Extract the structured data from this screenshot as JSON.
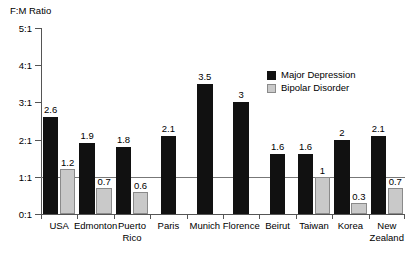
{
  "chart_data": {
    "type": "bar",
    "title": "",
    "ylabel": "F:M Ratio",
    "xlabel": "",
    "ylim": [
      0,
      5
    ],
    "ytick_labels": [
      "0:1",
      "1:1",
      "2:1",
      "3:1",
      "4:1",
      "5:1"
    ],
    "ytick_values": [
      0,
      1,
      2,
      3,
      4,
      5
    ],
    "grid": false,
    "reference_line": 1,
    "legend_position": "upper right",
    "categories": [
      "USA",
      "Edmonton",
      "Puerto\nRico",
      "Paris",
      "Munich",
      "Florence",
      "Beirut",
      "Taiwan",
      "Korea",
      "New\nZealand"
    ],
    "series": [
      {
        "name": "Major Depression",
        "color": "#111111",
        "values": [
          2.6,
          1.9,
          1.8,
          2.1,
          3.5,
          3,
          1.6,
          1.6,
          2,
          2.1
        ],
        "labels": [
          "2.6",
          "1.9",
          "1.8",
          "2.1",
          "3.5",
          "3",
          "1.6",
          "1.6",
          "2",
          "2.1"
        ]
      },
      {
        "name": "Bipolar Disorder",
        "color": "#c9c9c9",
        "values": [
          1.2,
          0.7,
          0.6,
          null,
          null,
          null,
          null,
          1,
          0.3,
          0.7
        ],
        "labels": [
          "1.2",
          "0.7",
          "0.6",
          "",
          "",
          "",
          "",
          "1",
          "0.3",
          "0.7"
        ]
      }
    ]
  },
  "legend": {
    "items": [
      {
        "label": "Major Depression"
      },
      {
        "label": "Bipolar Disorder"
      }
    ]
  },
  "colors": {
    "major_depression": "#111111",
    "bipolar_disorder": "#c9c9c9",
    "axis": "#555555",
    "reference_line": "#777777"
  }
}
